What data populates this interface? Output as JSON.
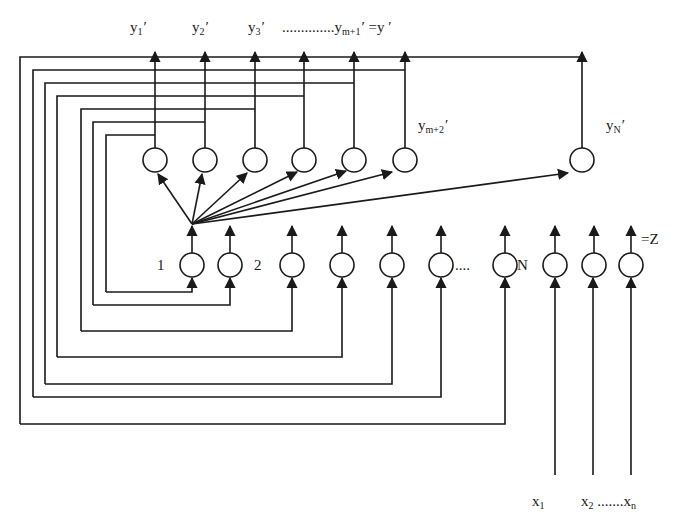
{
  "diagram": {
    "output_labels": [
      {
        "id": "y1",
        "base": "y",
        "sub": "1",
        "prime": "′",
        "x": 130,
        "y": 20
      },
      {
        "id": "y2",
        "base": "y",
        "sub": "2",
        "prime": "′",
        "x": 192,
        "y": 20
      },
      {
        "id": "y3",
        "base": "y",
        "sub": "3",
        "prime": "′",
        "x": 248,
        "y": 20
      }
    ],
    "output_series_label": {
      "dots": "..............",
      "base": "y",
      "sub": "m+1",
      "prime": "′",
      "eq": " =y ′"
    },
    "ym2_label": {
      "base": "y",
      "sub": "m+2",
      "prime": "′"
    },
    "yN_label": {
      "base": "y",
      "sub": "N",
      "prime": "′"
    },
    "hidden_labels": {
      "one": "1",
      "two": "2",
      "dots": "....",
      "n": "N",
      "z": "=Z"
    },
    "input_labels": {
      "x1_base": "x",
      "x1_sub": "1",
      "x2_base": "x",
      "x2_sub": "2",
      "dots": " .......",
      "xn_base": "x",
      "xn_sub": "n"
    },
    "colors": {
      "stroke": "#1a1a1a",
      "background": "#ffffff"
    },
    "upper_nodes_x": [
      155,
      205,
      255,
      304,
      354,
      405,
      582
    ],
    "lower_nodes_x": [
      192,
      230,
      292,
      342,
      392,
      441,
      505,
      555,
      594,
      631
    ],
    "input_lines_x": [
      555,
      593,
      631
    ]
  }
}
